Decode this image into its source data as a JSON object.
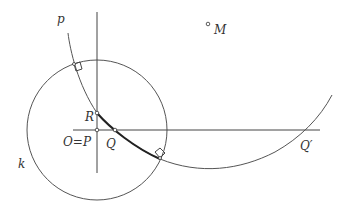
{
  "diagram": {
    "type": "geometry-construction",
    "stroke_color": "#444444",
    "bold_arc_color": "#222222",
    "labels": {
      "curve_p": "p",
      "point_M": "M",
      "point_R": "R",
      "point_OP": "O=P",
      "point_Q": "Q",
      "point_Q_prime": "Q′",
      "circle_k": "k"
    },
    "elements": {
      "circle_k": {
        "cx": 97,
        "cy": 130,
        "r": 70
      },
      "vertical_line": {
        "x": 97,
        "y1": 12,
        "y2": 173
      },
      "horizontal_line": {
        "y": 130,
        "x1": 73,
        "x2": 320
      },
      "points": {
        "M": [
          208,
          24
        ],
        "R": [
          97,
          113
        ],
        "O_P": [
          97,
          130
        ],
        "Q": [
          115,
          130
        ],
        "Q_prime": [
          308,
          130
        ]
      },
      "right_angle_markers": 2
    }
  }
}
